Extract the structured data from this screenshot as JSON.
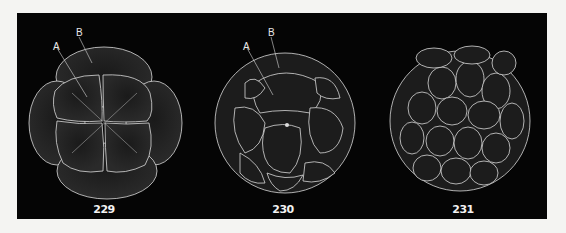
{
  "plate": {
    "background": "#050505",
    "line_color": "#d8d8d8",
    "figures": [
      {
        "number": "229",
        "labels": {
          "a": "A",
          "b": "B"
        }
      },
      {
        "number": "230",
        "labels": {
          "a": "A",
          "b": "B"
        }
      },
      {
        "number": "231"
      }
    ]
  }
}
